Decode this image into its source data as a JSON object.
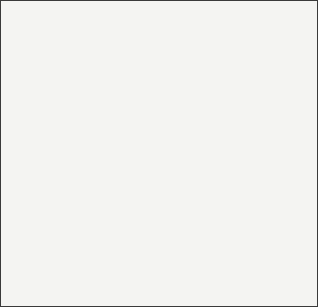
{
  "figure": {
    "background_color": "#f4f4f2",
    "frame_color": "#3a3a3a",
    "stroke_color": "#3b3b3b",
    "labels": [
      {
        "id": "a",
        "text": "a",
        "plane": "sagittal-plane",
        "x": 90,
        "y": 18
      },
      {
        "id": "b",
        "text": "b",
        "plane": "coronal-plane",
        "x": 207,
        "y": 22
      },
      {
        "id": "c",
        "text": "c",
        "plane": "axial-plane",
        "x": 12,
        "y": 120
      }
    ],
    "planes": [
      {
        "name": "sagittal-plane",
        "label": "a",
        "fill_upper": "#cfcfcf",
        "fill_lower": "#d9d9d9",
        "opacity": 0.85
      },
      {
        "name": "coronal-plane",
        "label": "b",
        "fill_upper": "#bdbdbd",
        "fill_lower": "#d2d2d2",
        "opacity": 0.8
      },
      {
        "name": "axial-plane",
        "label": "c",
        "fill_left": "#c9c9c9",
        "fill_right": "#dedede",
        "opacity": 0.8
      }
    ],
    "subject": {
      "name": "supine-human-head-and-torso",
      "head_fill": "#ffffff",
      "body_fill": "#ffffff",
      "outline_color": "#2e2e2e",
      "features": [
        "cranium",
        "face-profile",
        "nose",
        "chin",
        "ear",
        "neck",
        "shoulder",
        "torso"
      ]
    },
    "shadow_colors": {
      "deep": "#8f8f8f",
      "mid": "#a8a8a8",
      "light": "#c4c4c4"
    }
  }
}
